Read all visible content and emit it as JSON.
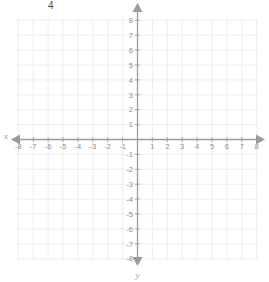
{
  "figure": {
    "kind": "coordinate-plane",
    "width": 269,
    "height": 282,
    "background_color": "#ffffff",
    "grid_color": "#e6e6e6",
    "axis_color": "#9b9b9b",
    "label_color": "#8e8e8e"
  },
  "annotations": [
    {
      "id": "four",
      "text": "4",
      "x": 48,
      "y": 1,
      "color": "#4a4a4a"
    }
  ],
  "axis_names": {
    "x": "x",
    "y": "y"
  },
  "chart_data": {
    "type": "scatter",
    "title": "",
    "subtitle": "",
    "xlabel": "x",
    "ylabel": "y",
    "xlim": [
      -8.5,
      8.5
    ],
    "ylim": [
      -8.5,
      8.5
    ],
    "grid": true,
    "legend": null,
    "series": [],
    "x_ticks": [
      -8,
      -7,
      -6,
      -5,
      -4,
      -3,
      -2,
      -1,
      1,
      2,
      3,
      4,
      5,
      6,
      7,
      8
    ],
    "x_tick_labels": [
      "-8",
      "-7",
      "-6",
      "-5",
      "-4",
      "-3",
      "-2",
      "-1",
      "1",
      "2",
      "3",
      "4",
      "5",
      "6",
      "7",
      "8"
    ],
    "y_ticks": [
      8,
      7,
      6,
      5,
      4,
      3,
      2,
      1,
      -1,
      -2,
      -3,
      -4,
      -5,
      -6,
      -7,
      -8
    ],
    "y_tick_labels": [
      "8",
      "7",
      "6",
      "5",
      "4",
      "3",
      "2",
      "1",
      "-1",
      "-2",
      "-3",
      "-4",
      "-5",
      "-6",
      "-7",
      "-8"
    ],
    "annotations": [
      {
        "text": "4",
        "note": "stray numeral near upper-left of image"
      }
    ]
  }
}
